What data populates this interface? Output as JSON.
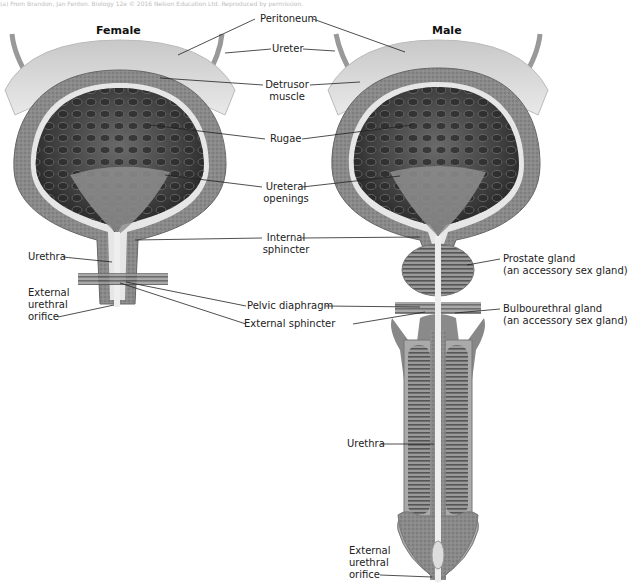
{
  "caption": "(a) From Brandon, Jan Fenton. Biology 12e © 2016 Nelson Education Ltd. Reproduced by permission.",
  "titles": {
    "female": "Female",
    "male": "Male"
  },
  "labels": {
    "peritoneum": "Peritoneum",
    "ureter": "Ureter",
    "detrusor_1": "Detrusor",
    "detrusor_2": "muscle",
    "rugae": "Rugae",
    "ureteral_1": "Ureteral",
    "ureteral_2": "openings",
    "internal_1": "Internal",
    "internal_2": "sphincter",
    "urethra_female": "Urethra",
    "ext_orifice_f_1": "External",
    "ext_orifice_f_2": "urethral",
    "ext_orifice_f_3": "orifice",
    "pelvic": "Pelvic diaphragm",
    "external_sphincter": "External sphincter",
    "prostate_1": "Prostate gland",
    "prostate_2": "(an accessory sex gland)",
    "bulbo_1": "Bulbourethral gland",
    "bulbo_2": "(an accessory sex gland)",
    "urethra_male": "Urethra",
    "ext_orifice_m_1": "External",
    "ext_orifice_m_2": "urethral",
    "ext_orifice_m_3": "orifice"
  },
  "colors": {
    "peritoneum": "#d8d8d8",
    "wall": "#8e8e8e",
    "lining": "#e8e8e8",
    "interior": "#3a3a3a",
    "trigone": "#9a9a9a",
    "tissue": "#7a7a7a",
    "leader": "#222222"
  }
}
